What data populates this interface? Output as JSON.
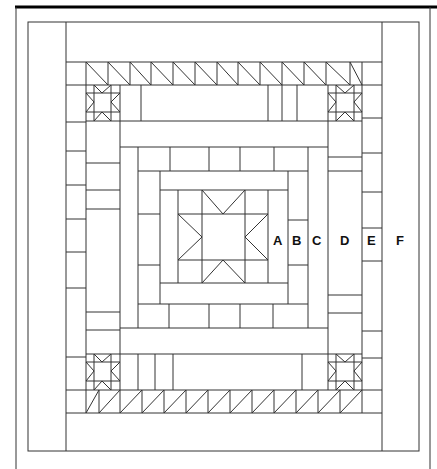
{
  "diagram": {
    "type": "quilt-layout",
    "colors": {
      "line": "#333333",
      "frame": "#000000",
      "background": "#ffffff"
    },
    "labels": [
      {
        "text": "A",
        "x": 279,
        "y": 245
      },
      {
        "text": "B",
        "x": 298,
        "y": 245
      },
      {
        "text": "C",
        "x": 318,
        "y": 245
      },
      {
        "text": "D",
        "x": 345,
        "y": 245
      },
      {
        "text": "E",
        "x": 372,
        "y": 245
      },
      {
        "text": "F",
        "x": 401,
        "y": 245
      }
    ],
    "rings": [
      "A",
      "B",
      "C",
      "D",
      "E",
      "F"
    ],
    "center_block": "star",
    "corner_blocks": "star",
    "sawtooth_borders": [
      "top",
      "bottom"
    ]
  }
}
